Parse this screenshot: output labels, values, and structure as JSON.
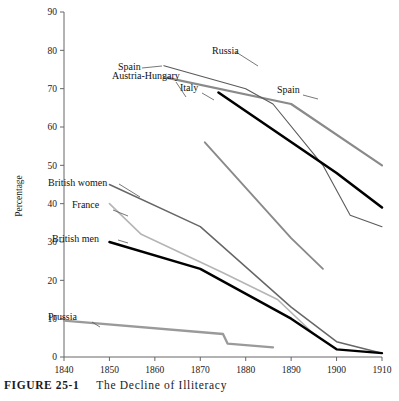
{
  "figure": {
    "number_label": "FIGURE 25-1",
    "caption_text": "The Decline of Illiteracy"
  },
  "chart_data": {
    "type": "line",
    "title": "The Decline of Illiteracy",
    "xlabel": "",
    "ylabel": "Percentage",
    "xlim": [
      1835,
      1910
    ],
    "ylim": [
      0,
      90
    ],
    "xticks": [
      "1840",
      "1850",
      "1860",
      "1870",
      "1880",
      "1890",
      "1900",
      "1910"
    ],
    "yticks": [
      "0",
      "10",
      "20",
      "30",
      "40",
      "50",
      "60",
      "70",
      "80",
      "90"
    ],
    "grid": false,
    "legend": "inline-labels",
    "series": [
      {
        "name": "Spain",
        "color": "#8a8a8a",
        "width": 2.2,
        "label_x": 118,
        "label_y": 70,
        "leader": [
          [
            142,
            68
          ],
          [
            162,
            66
          ]
        ],
        "points": [
          [
            1862,
            73
          ],
          [
            1890,
            66
          ],
          [
            1910,
            50
          ]
        ]
      },
      {
        "name": "Russia",
        "color": "#5a5a5a",
        "width": 1.1,
        "label_x": 212,
        "label_y": 54,
        "leader": [
          [
            236,
            52
          ],
          [
            258,
            66
          ]
        ],
        "points": [
          [
            1862,
            76
          ],
          [
            1880,
            70
          ],
          [
            1886,
            66
          ],
          [
            1897,
            50
          ],
          [
            1903,
            37
          ],
          [
            1910,
            34
          ]
        ]
      },
      {
        "name": "Italy",
        "color": "#000000",
        "width": 2.6,
        "label_x": 180,
        "label_y": 91,
        "leader": [
          [
            202,
            93
          ],
          [
            214,
            100
          ]
        ],
        "points": [
          [
            1874,
            69
          ],
          [
            1900,
            48
          ],
          [
            1910,
            39
          ]
        ]
      },
      {
        "name": "Spain",
        "color": "#8a8a8a",
        "width": 2.2,
        "label_x": 277,
        "label_y": 93,
        "leader": [
          [
            303,
            95
          ],
          [
            318,
            99
          ]
        ],
        "points": []
      },
      {
        "name": "Austria-Hungary",
        "color": "#8a8a8a",
        "width": 1.9,
        "label_x": 112,
        "label_y": 79,
        "leader": [
          [
            176,
            82
          ],
          [
            186,
            97
          ]
        ],
        "points": [
          [
            1871,
            56
          ],
          [
            1890,
            31
          ],
          [
            1897,
            23
          ]
        ]
      },
      {
        "name": "British women",
        "color": "#666666",
        "width": 1.5,
        "label_x": 48,
        "label_y": 186,
        "leader": [
          [
            119,
            184
          ],
          [
            140,
            197
          ]
        ],
        "points": [
          [
            1850,
            45
          ],
          [
            1870,
            34
          ],
          [
            1890,
            13
          ],
          [
            1900,
            4
          ],
          [
            1910,
            1
          ]
        ]
      },
      {
        "name": "France",
        "color": "#b5b5b5",
        "width": 1.6,
        "label_x": 72,
        "label_y": 208,
        "leader": [
          [
            113,
            210
          ],
          [
            128,
            216
          ]
        ],
        "points": [
          [
            1850,
            40
          ],
          [
            1857,
            32
          ],
          [
            1875,
            22
          ],
          [
            1887,
            15
          ],
          [
            1895,
            6
          ]
        ]
      },
      {
        "name": "British men",
        "color": "#000000",
        "width": 2.4,
        "label_x": 52,
        "label_y": 242,
        "leader": [
          [
            118,
            240
          ],
          [
            128,
            243
          ]
        ],
        "points": [
          [
            1850,
            30
          ],
          [
            1870,
            23
          ],
          [
            1890,
            10
          ],
          [
            1900,
            2
          ],
          [
            1910,
            1
          ]
        ]
      },
      {
        "name": "Prussia",
        "color": "#9a9a9a",
        "width": 2.3,
        "label_x": 48,
        "label_y": 320,
        "leader": [
          [
            92,
            322
          ],
          [
            100,
            327
          ]
        ],
        "points": [
          [
            1840,
            9.5
          ],
          [
            1875,
            6
          ],
          [
            1876,
            3.5
          ],
          [
            1886,
            2.5
          ]
        ]
      }
    ]
  }
}
